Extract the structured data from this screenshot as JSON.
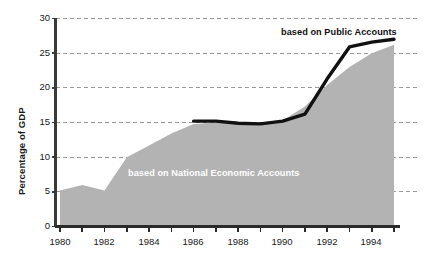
{
  "chart_data": {
    "type": "area",
    "title": "",
    "subtitle": "",
    "xlabel": "",
    "ylabel": "Percentage of GDP",
    "xlim": [
      1980,
      1995
    ],
    "ylim": [
      0,
      30
    ],
    "grid": true,
    "grid_style": "dashed-horizontal",
    "legend_position": "inline-annotations",
    "x": [
      1980,
      1981,
      1982,
      1983,
      1984,
      1985,
      1986,
      1987,
      1988,
      1989,
      1990,
      1991,
      1992,
      1993,
      1994,
      1995
    ],
    "x_tick_labels": [
      "1980",
      "1982",
      "1984",
      "1986",
      "1988",
      "1990",
      "1992",
      "1994"
    ],
    "x_tick_values": [
      1980,
      1982,
      1984,
      1986,
      1988,
      1990,
      1992,
      1994
    ],
    "y_tick_labels": [
      "0",
      "5",
      "10",
      "15",
      "20",
      "25",
      "30"
    ],
    "y_tick_values": [
      0,
      5,
      10,
      15,
      20,
      25,
      30
    ],
    "series": [
      {
        "name": "based on National Economic Accounts",
        "type": "area",
        "color": "#b3b3b3",
        "x": [
          1980,
          1981,
          1982,
          1983,
          1984,
          1985,
          1986,
          1987,
          1988,
          1989,
          1990,
          1991,
          1992,
          1993,
          1994,
          1995
        ],
        "values": [
          5.2,
          6.0,
          5.2,
          10.0,
          11.7,
          13.4,
          14.8,
          15.0,
          14.8,
          14.6,
          15.3,
          17.3,
          20.4,
          23.0,
          25.0,
          26.2
        ]
      },
      {
        "name": "based on Public Accounts",
        "type": "line",
        "color": "#111111",
        "x": [
          1986,
          1987,
          1988,
          1989,
          1990,
          1991,
          1992,
          1993,
          1994,
          1995
        ],
        "values": [
          15.2,
          15.2,
          14.9,
          14.8,
          15.2,
          16.2,
          21.3,
          25.9,
          26.6,
          27.0
        ]
      }
    ],
    "annotations": [
      {
        "text": "based on National Economic Accounts",
        "color": "#ffffff",
        "x": 1983.3,
        "y": 8.3
      },
      {
        "text": "based on Public Accounts",
        "color": "#111111",
        "x": 1990.2,
        "y": 28.3
      }
    ]
  },
  "axes": {
    "y_title": "Percentage of GDP",
    "y_ticks": [
      "30",
      "25",
      "20",
      "15",
      "10",
      "5",
      "0"
    ],
    "x_ticks": [
      "1980",
      "1982",
      "1984",
      "1986",
      "1988",
      "1990",
      "1992",
      "1994"
    ]
  },
  "annotations": {
    "national_economic_accounts": "based on National Economic Accounts",
    "public_accounts": "based on Public Accounts"
  },
  "colors": {
    "area_fill": "#b3b3b3",
    "line": "#111111",
    "axis": "#3a3a3a",
    "grid": "#9a9a9a",
    "text": "#1a1a1a",
    "background": "#ffffff"
  }
}
